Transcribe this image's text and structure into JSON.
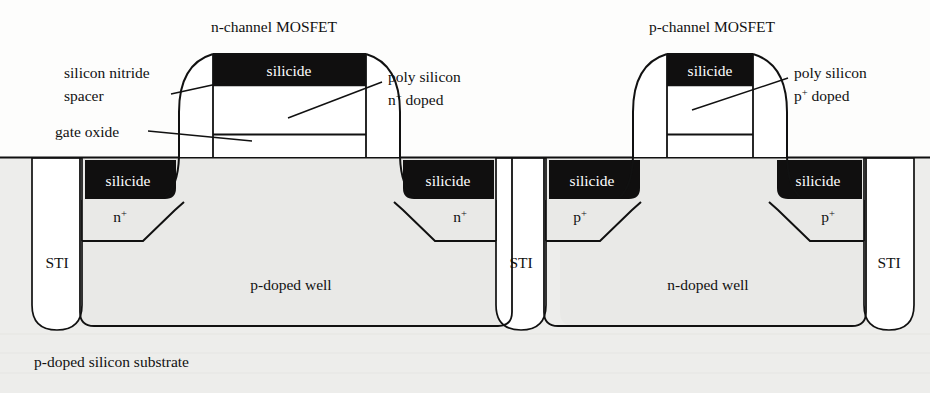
{
  "figure": {
    "type": "cross-section-diagram",
    "background_color": "#fdfdfc",
    "line_color": "#111111",
    "fill_silicon": "#e9e9e7",
    "fill_silicide": "#100f0f",
    "fill_white": "#ffffff"
  },
  "titles": {
    "left_device": "n-channel MOSFET",
    "right_device": "p-channel MOSFET"
  },
  "callouts": {
    "spacer_line1": "silicon nitride",
    "spacer_line2": "spacer",
    "gate_oxide": "gate oxide",
    "poly_n_line1": "poly silicon",
    "poly_n_line2_base": "n",
    "poly_n_line2_sup": "+",
    "poly_n_line2_tail": " doped",
    "poly_p_line1": "poly silicon",
    "poly_p_line2_base": "p",
    "poly_p_line2_sup": "+",
    "poly_p_line2_tail": " doped"
  },
  "regions": {
    "gate_silicide_left": "silicide",
    "gate_silicide_right": "silicide",
    "sd_silicide_1": "silicide",
    "sd_silicide_2": "silicide",
    "sd_silicide_3": "silicide",
    "sd_silicide_4": "silicide",
    "nplus_left_base": "n",
    "nplus_left_sup": "+",
    "nplus_right_base": "n",
    "nplus_right_sup": "+",
    "pplus_left_base": "p",
    "pplus_left_sup": "+",
    "pplus_right_base": "p",
    "pplus_right_sup": "+",
    "sti_1": "STI",
    "sti_2": "STI",
    "sti_3": "STI",
    "pwell": "p-doped well",
    "nwell": "n-doped well",
    "substrate": "p-doped silicon substrate"
  }
}
